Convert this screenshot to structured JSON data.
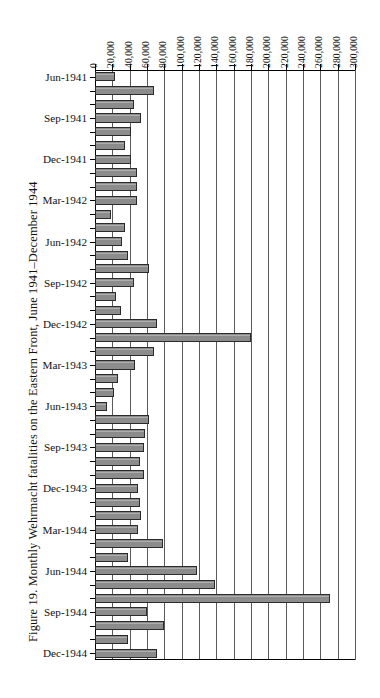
{
  "figure": {
    "caption": "Figure 19. Monthly Wehrmacht fatalities on the Eastern Front, June 1941–December 1944"
  },
  "chart_data": {
    "type": "bar",
    "orientation": "horizontal",
    "title": "Figure 19. Monthly Wehrmacht fatalities on the Eastern Front, June 1941–December 1944",
    "xlabel": "",
    "ylabel": "",
    "xlim": [
      0,
      300000
    ],
    "grid": true,
    "axis_position": "top",
    "legend": "none",
    "tick_labels": [
      "0",
      "20,000",
      "40,000",
      "60,000",
      "80,000",
      "100,000",
      "120,000",
      "140,000",
      "160,000",
      "180,000",
      "200,000",
      "220,000",
      "240,000",
      "260,000",
      "280,000",
      "300,000"
    ],
    "tick_values": [
      0,
      20000,
      40000,
      60000,
      80000,
      100000,
      120000,
      140000,
      160000,
      180000,
      200000,
      220000,
      240000,
      260000,
      280000,
      300000
    ],
    "visible_category_labels": [
      "Jun-1941",
      "Sep-1941",
      "Dec-1941",
      "Mar-1942",
      "Jun-1942",
      "Sep-1942",
      "Dec-1942",
      "Mar-1943",
      "Jun-1943",
      "Sep-1943",
      "Dec-1943",
      "Mar-1944",
      "Jun-1944",
      "Sep-1944",
      "Dec-1944"
    ],
    "categories": [
      "Jun-1941",
      "Jul-1941",
      "Aug-1941",
      "Sep-1941",
      "Oct-1941",
      "Nov-1941",
      "Dec-1941",
      "Jan-1942",
      "Feb-1942",
      "Mar-1942",
      "Apr-1942",
      "May-1942",
      "Jun-1942",
      "Jul-1942",
      "Aug-1942",
      "Sep-1942",
      "Oct-1942",
      "Nov-1942",
      "Dec-1942",
      "Jan-1943",
      "Feb-1943",
      "Mar-1943",
      "Apr-1943",
      "May-1943",
      "Jun-1943",
      "Jul-1943",
      "Aug-1943",
      "Sep-1943",
      "Oct-1943",
      "Nov-1943",
      "Dec-1943",
      "Jan-1944",
      "Feb-1944",
      "Mar-1944",
      "Apr-1944",
      "May-1944",
      "Jun-1944",
      "Jul-1944",
      "Aug-1944",
      "Sep-1944",
      "Oct-1944",
      "Nov-1944",
      "Dec-1944"
    ],
    "values": [
      23000,
      68000,
      45000,
      53000,
      41000,
      35000,
      41000,
      49000,
      48000,
      49000,
      19000,
      35000,
      31000,
      38000,
      62000,
      45000,
      24000,
      30000,
      72000,
      180000,
      68000,
      46000,
      27000,
      22000,
      14000,
      62000,
      58000,
      56000,
      52000,
      56000,
      50000,
      52000,
      53000,
      50000,
      79000,
      38000,
      118000,
      138000,
      271000,
      60000,
      80000,
      38000,
      71000
    ]
  }
}
